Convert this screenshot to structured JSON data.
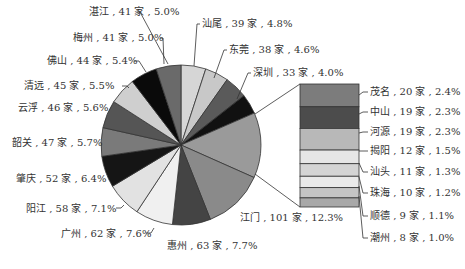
{
  "chart_data": {
    "type": "pie",
    "title": "",
    "unit": "家",
    "pie": {
      "center": [
        181,
        145
      ],
      "radius": 80,
      "slices": [
        {
          "name": "湛江",
          "value": 41,
          "percent": "5.0%",
          "color": "#d6d6d6",
          "label": "湛江 , 41  家 , 5.0%"
        },
        {
          "name": "汕尾",
          "value": 39,
          "percent": "4.8%",
          "color": "#c8c8c8",
          "label": "汕尾 , 39  家 , 4.8%"
        },
        {
          "name": "东莞",
          "value": 38,
          "percent": "4.6%",
          "color": "#5a5a5a",
          "label": "东莞 , 38  家 , 4.6%"
        },
        {
          "name": "深圳",
          "value": 33,
          "percent": "4.0%",
          "color": "#111111",
          "label": "深圳 , 33  家 , 4.0%"
        },
        {
          "name": "其他",
          "value": 108,
          "percent": "13.1%",
          "color": "#9a9a9a",
          "label": ""
        },
        {
          "name": "江门",
          "value": 101,
          "percent": "12.3%",
          "color": "#8a8a8a",
          "label": "江门 , 101  家 , 12.3%"
        },
        {
          "name": "惠州",
          "value": 63,
          "percent": "7.7%",
          "color": "#444444",
          "label": "惠州 , 63  家 , 7.7%"
        },
        {
          "name": "广州",
          "value": 62,
          "percent": "7.6%",
          "color": "#f0f0f0",
          "label": "广州 , 62  家 , 7.6%"
        },
        {
          "name": "阳江",
          "value": 58,
          "percent": "7.1%",
          "color": "#e2e2e2",
          "label": "阳江 , 58  家 , 7.1%"
        },
        {
          "name": "肇庆",
          "value": 52,
          "percent": "6.4%",
          "color": "#151515",
          "label": "肇庆 , 52  家 , 6.4%"
        },
        {
          "name": "韶关",
          "value": 47,
          "percent": "5.7%",
          "color": "#7a7a7a",
          "label": "韶关 , 47  家 , 5.7%"
        },
        {
          "name": "云浮",
          "value": 46,
          "percent": "5.6%",
          "color": "#555555",
          "label": "云浮 , 46  家 , 5.6%"
        },
        {
          "name": "清远",
          "value": 45,
          "percent": "5.5%",
          "color": "#cfcfcf",
          "label": "清远 , 45  家 , 5.5%"
        },
        {
          "name": "佛山",
          "value": 44,
          "percent": "5.4%",
          "color": "#0a0a0a",
          "label": "佛山 , 44  家 , 5.4%"
        },
        {
          "name": "梅州",
          "value": 41,
          "percent": "5.0%",
          "color": "#6a6a6a",
          "label": "梅州 , 41  家 , 5.0%"
        }
      ]
    },
    "bar": {
      "x": 300,
      "y": 84,
      "width": 59,
      "height": 123,
      "segments": [
        {
          "name": "茂名",
          "value": 20,
          "percent": "2.4%",
          "color": "#7c7c7c",
          "label": "茂名 , 20  家 , 2.4%"
        },
        {
          "name": "中山",
          "value": 19,
          "percent": "2.3%",
          "color": "#4c4c4c",
          "label": "中山 , 19  家 , 2.3%"
        },
        {
          "name": "河源",
          "value": 19,
          "percent": "2.3%",
          "color": "#b8b8b8",
          "label": "河源 , 19  家 , 2.3%"
        },
        {
          "name": "揭阳",
          "value": 12,
          "percent": "1.5%",
          "color": "#e6e6e6",
          "label": "揭阳 , 12  家 , 1.5%"
        },
        {
          "name": "汕头",
          "value": 11,
          "percent": "1.3%",
          "color": "#d4d4d4",
          "label": "汕头 , 11  家 , 1.3%"
        },
        {
          "name": "珠海",
          "value": 10,
          "percent": "1.2%",
          "color": "#e9e9e9",
          "label": "珠海 , 10  家 , 1.2%"
        },
        {
          "name": "顺德",
          "value": 9,
          "percent": "1.1%",
          "color": "#c4c4c4",
          "label": "顺德 , 9  家 , 1.1%"
        },
        {
          "name": "潮州",
          "value": 8,
          "percent": "1.0%",
          "color": "#a8a8a8",
          "label": "潮州 , 8  家 , 1.0%"
        }
      ]
    },
    "legend": "none",
    "grid": false
  },
  "labels": {
    "zhanjiang": "湛江 , 41  家 , 5.0%",
    "meizhou": "梅州 , 41  家 , 5.0%",
    "foshan": "佛山 , 44  家 , 5.4%",
    "qingyuan": "清远 , 45  家 , 5.5%",
    "yunfu": "云浮 , 46  家 , 5.6%",
    "shaoguan": "韶关 , 47  家 , 5.7%",
    "zhaoqing": "肇庆 , 52  家 , 6.4%",
    "yangjiang": "阳江 , 58  家 , 7.1%",
    "guangzhou": "广州 , 62  家 , 7.6%",
    "huizhou": "惠州 , 63  家 , 7.7%",
    "jiangmen": "江门 , 101  家 , 12.3%",
    "shanwei": "汕尾 , 39  家 , 4.8%",
    "dongguan": "东莞 , 38  家 , 4.6%",
    "shenzhen": "深圳 , 33  家 , 4.0%",
    "maoming": "茂名 , 20  家 , 2.4%",
    "zhongshan": "中山 , 19  家 , 2.3%",
    "heyuan": "河源 , 19  家 , 2.3%",
    "jieyang": "揭阳 , 12  家 , 1.5%",
    "shantou": "汕头 , 11  家 , 1.3%",
    "zhuhai": "珠海 , 10  家 , 1.2%",
    "shunde": "顺德 , 9  家 , 1.1%",
    "chaozhou": "潮州 , 8  家 , 1.0%"
  }
}
